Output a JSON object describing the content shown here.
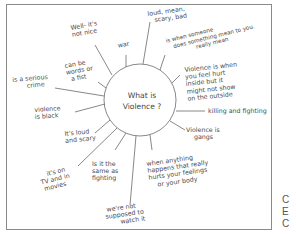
{
  "diagram": {
    "center": {
      "line1": "What is",
      "line2": "Violence ?"
    },
    "nodes": [
      {
        "id": "well-its-not-nice",
        "lines": [
          "Well- it's",
          "not nice"
        ]
      },
      {
        "id": "war",
        "lines": [
          "war"
        ]
      },
      {
        "id": "loud-mean-scary-bad",
        "lines": [
          "loud, mean,",
          "scary, bad"
        ]
      },
      {
        "id": "someone-does-something-mean",
        "lines": [
          "is when someone",
          "does something mean to you.",
          "really mean"
        ]
      },
      {
        "id": "hurt-inside",
        "lines": [
          "Violence is when",
          "you feel hurt",
          "inside but it",
          "might not show",
          "on the outside"
        ]
      },
      {
        "id": "killing-fighting",
        "lines": [
          "killing and fighting"
        ]
      },
      {
        "id": "gangs",
        "lines": [
          "Violence is",
          "gangs"
        ]
      },
      {
        "id": "hurts-feelings-body",
        "lines": [
          "when anything",
          "happens that really",
          "hurts your feelings",
          "or your body"
        ]
      },
      {
        "id": "not-supposed-to-watch",
        "lines": [
          "we're not",
          "supposed to",
          "watch it"
        ]
      },
      {
        "id": "same-as-fighting",
        "lines": [
          "Is it the",
          "same as",
          "fighting"
        ]
      },
      {
        "id": "tv-and-movies",
        "lines": [
          "it's on",
          "TV and in",
          "movies"
        ]
      },
      {
        "id": "loud-and-scary",
        "lines": [
          "It's loud",
          "and scary"
        ]
      },
      {
        "id": "violence-is-black",
        "lines": [
          "violence",
          "is black"
        ]
      },
      {
        "id": "serious-crime",
        "lines": [
          "is a serious",
          "crime"
        ]
      },
      {
        "id": "words-or-fist",
        "lines": [
          "can be",
          "words or",
          "a fist"
        ]
      }
    ]
  },
  "margin_text": [
    "C",
    "E",
    "C"
  ]
}
